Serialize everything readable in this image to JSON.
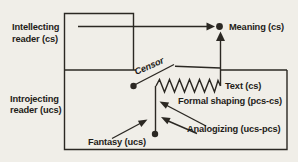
{
  "diagram": {
    "title_hint": "reader-response model diagram",
    "labels": {
      "intellecting": {
        "line1": "Intellecting",
        "line2": "reader (cs)"
      },
      "introjecting": {
        "line1": "Introjecting",
        "line2": "reader (ucs)"
      },
      "meaning": "Meaning (cs)",
      "censor": "Censor",
      "text": "Text (cs)",
      "formal_shaping": "Formal shaping  (pcs-cs)",
      "analogizing": "Analogizing (ucs-pcs)",
      "fantasy": "Fantasy (ucs)"
    },
    "colors": {
      "ink": "#2b2823",
      "paper": "#f0eee8"
    }
  }
}
